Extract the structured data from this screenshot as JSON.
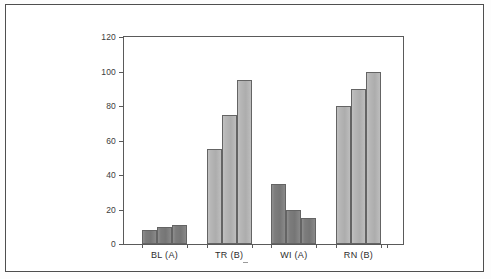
{
  "chart_data": {
    "type": "bar",
    "title": "",
    "subtitle": "",
    "xlabel": "",
    "ylabel": "",
    "categories": [
      "BL (A)",
      "TR (B)",
      "WI (A)",
      "RN (B)"
    ],
    "series": [
      {
        "name": "Bar 1",
        "values": [
          8,
          55,
          35,
          80
        ]
      },
      {
        "name": "Bar 2",
        "values": [
          10,
          75,
          20,
          90
        ]
      },
      {
        "name": "Bar 3",
        "values": [
          11,
          95,
          15,
          100
        ]
      }
    ],
    "group_styles": [
      "dark",
      "light",
      "dark",
      "light"
    ],
    "ylim": [
      0,
      120
    ],
    "ytick_values": [
      0,
      20,
      40,
      60,
      80,
      100,
      120
    ],
    "ytick_labels": [
      "0",
      "20",
      "40",
      "60",
      "80",
      "100",
      "120"
    ],
    "grid": false,
    "legend": "none",
    "colors": {
      "bar_dark": "#7c7c7c",
      "bar_light": "#b6b6b6",
      "bar_outline": "#646464",
      "axis": "#5a5a5a",
      "frame": "#4a4a4a",
      "text": "#2e2e2e",
      "background": "#ffffff"
    }
  }
}
